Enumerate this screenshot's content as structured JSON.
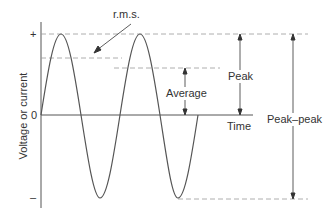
{
  "diagram": {
    "axis": {
      "y_label": "Voltage or current",
      "x_label": "Time",
      "plus_tick": "+",
      "zero_tick": "0",
      "minus_tick": "–"
    },
    "annotations": {
      "rms": "r.m.s.",
      "average": "Average",
      "peak": "Peak",
      "peak_peak": "Peak–peak"
    },
    "colors": {
      "line": "#555555",
      "dashed": "#999999",
      "text": "#333333"
    }
  }
}
